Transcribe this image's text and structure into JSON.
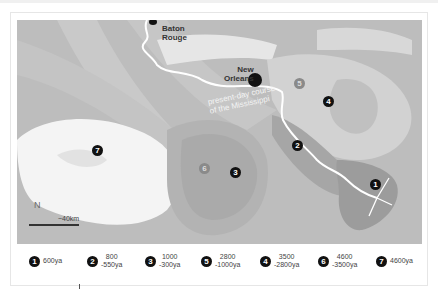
{
  "map": {
    "cities": [
      {
        "name": "Baton Rouge",
        "line1": "Baton",
        "line2": "Rouge"
      },
      {
        "name": "New Orleans",
        "line1": "New",
        "line2": "Orleans"
      }
    ],
    "river_label": {
      "line1": "present-day course",
      "line2": "of the Mississippi"
    },
    "markers": [
      {
        "id": "1",
        "label": "1"
      },
      {
        "id": "2",
        "label": "2"
      },
      {
        "id": "3",
        "label": "3"
      },
      {
        "id": "4",
        "label": "4"
      },
      {
        "id": "5",
        "label": "5"
      },
      {
        "id": "6",
        "label": "6"
      },
      {
        "id": "7",
        "label": "7"
      }
    ],
    "north_label": "N",
    "scale_label": "~40km",
    "colors": {
      "land": "#bdbdbd",
      "lobe_light": "#f2f2f2",
      "lobe_mid": "#cfcfcf",
      "lobe_dark": "#9e9e9e",
      "river": "#ffffff"
    }
  },
  "legend": {
    "items": [
      {
        "num": "1",
        "line1": "600ya",
        "line2": ""
      },
      {
        "num": "2",
        "line1": "800",
        "line2": "-550ya"
      },
      {
        "num": "3",
        "line1": "1000",
        "line2": "-300ya"
      },
      {
        "num": "5",
        "line1": "2800",
        "line2": "-1000ya"
      },
      {
        "num": "4",
        "line1": "3500",
        "line2": "-2800ya"
      },
      {
        "num": "6",
        "line1": "4600",
        "line2": "-3500ya"
      },
      {
        "num": "7",
        "line1": "4600ya",
        "line2": ""
      }
    ]
  }
}
